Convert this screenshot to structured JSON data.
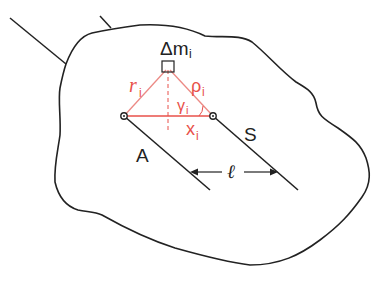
{
  "diagram": {
    "type": "parallel-axis theorem illustration",
    "colors": {
      "outline": "#222222",
      "construction": "#e8504a",
      "background": "#ffffff"
    },
    "labels": {
      "mass_element": "Δm",
      "mass_element_sub": "i",
      "r": "r",
      "r_sub": "i",
      "rho": "ρ",
      "rho_sub": "i",
      "gamma": "γ",
      "gamma_sub": "i",
      "x": "x",
      "x_sub": "i",
      "axis_a": "A",
      "axis_s": "S",
      "distance": "ℓ"
    },
    "points": {
      "A": [
        124,
        116
      ],
      "S": [
        213,
        116
      ],
      "mass": [
        169,
        67
      ]
    }
  }
}
